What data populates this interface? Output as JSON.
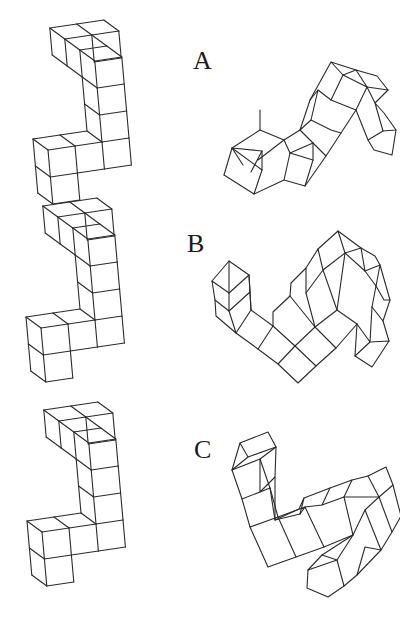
{
  "figure": {
    "pairs": [
      {
        "label": "A",
        "label_pos": [
          193,
          48
        ]
      },
      {
        "label": "B",
        "label_pos": [
          187,
          231
        ]
      },
      {
        "label": "C",
        "label_pos": [
          194,
          437
        ]
      }
    ]
  },
  "shapes": [
    {
      "id": "A-left",
      "cubes": 10,
      "origin": [
        48,
        150
      ],
      "vectors": {
        "a": [
          27,
          -4
        ],
        "v": [
          2.4,
          27
        ],
        "d": [
          -15,
          -11
        ]
      },
      "cells": [
        [
          0,
          0,
          0
        ],
        [
          0,
          1,
          0
        ],
        [
          1,
          0,
          0
        ],
        [
          2,
          0,
          0
        ],
        [
          2,
          -1,
          0
        ],
        [
          2,
          -2,
          0
        ],
        [
          2,
          -3,
          0
        ],
        [
          2,
          -3,
          1
        ],
        [
          2,
          -3,
          2
        ],
        [
          3,
          -3,
          2
        ]
      ]
    },
    {
      "id": "B-left",
      "cubes": 10,
      "origin": [
        41,
        328
      ],
      "vectors": {
        "a": [
          27,
          -4
        ],
        "v": [
          2.4,
          27
        ],
        "d": [
          -15,
          -11
        ]
      },
      "cells": [
        [
          0,
          0,
          0
        ],
        [
          0,
          1,
          0
        ],
        [
          1,
          0,
          0
        ],
        [
          2,
          0,
          0
        ],
        [
          2,
          -1,
          0
        ],
        [
          2,
          -2,
          0
        ],
        [
          2,
          -3,
          0
        ],
        [
          2,
          -3,
          1
        ],
        [
          2,
          -3,
          2
        ],
        [
          3,
          -3,
          2
        ]
      ]
    },
    {
      "id": "C-left",
      "cubes": 10,
      "origin": [
        42,
        532
      ],
      "vectors": {
        "a": [
          27,
          -4
        ],
        "v": [
          2.4,
          27
        ],
        "d": [
          -15,
          -11
        ]
      },
      "cells": [
        [
          0,
          0,
          0
        ],
        [
          0,
          1,
          0
        ],
        [
          1,
          0,
          0
        ],
        [
          2,
          0,
          0
        ],
        [
          2,
          -1,
          0
        ],
        [
          2,
          -2,
          0
        ],
        [
          2,
          -3,
          0
        ],
        [
          2,
          -3,
          1
        ],
        [
          2,
          -3,
          2
        ],
        [
          3,
          -3,
          2
        ]
      ]
    }
  ],
  "segments": {
    "A-right": [
      [
        [
          232,
          148
        ],
        [
          262,
          170
        ],
        [
          262,
          151
        ],
        [
          232,
          148
        ]
      ],
      [
        [
          232,
          148
        ],
        [
          260,
          130
        ],
        [
          284,
          140
        ],
        [
          258,
          160
        ]
      ],
      [
        [
          260,
          130
        ],
        [
          260,
          110
        ]
      ],
      [
        [
          224,
          175
        ],
        [
          232,
          148
        ]
      ],
      [
        [
          224,
          175
        ],
        [
          254,
          194
        ],
        [
          262,
          170
        ]
      ],
      [
        [
          254,
          194
        ],
        [
          284,
          180
        ],
        [
          290,
          153
        ]
      ],
      [
        [
          284,
          180
        ],
        [
          305,
          186
        ],
        [
          313,
          160
        ],
        [
          290,
          153
        ]
      ],
      [
        [
          284,
          140
        ],
        [
          290,
          153
        ]
      ],
      [
        [
          284,
          140
        ],
        [
          300,
          130
        ],
        [
          313,
          143
        ],
        [
          290,
          153
        ]
      ],
      [
        [
          313,
          143
        ],
        [
          313,
          160
        ]
      ],
      [
        [
          305,
          186
        ],
        [
          326,
          156
        ],
        [
          313,
          143
        ]
      ],
      [
        [
          300,
          130
        ],
        [
          310,
          100
        ],
        [
          318,
          90
        ],
        [
          311,
          120
        ],
        [
          300,
          130
        ]
      ],
      [
        [
          310,
          100
        ],
        [
          331,
          62
        ],
        [
          343,
          75
        ],
        [
          331,
          100
        ],
        [
          318,
          90
        ]
      ],
      [
        [
          331,
          62
        ],
        [
          356,
          70
        ],
        [
          343,
          75
        ]
      ],
      [
        [
          343,
          75
        ],
        [
          367,
          87
        ],
        [
          356,
          70
        ]
      ],
      [
        [
          331,
          100
        ],
        [
          356,
          110
        ],
        [
          367,
          87
        ]
      ],
      [
        [
          311,
          120
        ],
        [
          331,
          130
        ],
        [
          341,
          133
        ]
      ],
      [
        [
          326,
          156
        ],
        [
          341,
          133
        ],
        [
          356,
          110
        ]
      ],
      [
        [
          356,
          70
        ],
        [
          377,
          76
        ],
        [
          388,
          90
        ],
        [
          367,
          87
        ]
      ],
      [
        [
          367,
          87
        ],
        [
          375,
          103
        ],
        [
          388,
          90
        ]
      ],
      [
        [
          375,
          103
        ],
        [
          384,
          113
        ],
        [
          396,
          130
        ],
        [
          383,
          131
        ],
        [
          375,
          103
        ]
      ],
      [
        [
          356,
          110
        ],
        [
          368,
          140
        ],
        [
          383,
          131
        ]
      ],
      [
        [
          368,
          140
        ],
        [
          374,
          150
        ],
        [
          392,
          155
        ],
        [
          396,
          130
        ]
      ],
      [
        [
          251,
          172
        ],
        [
          262,
          151
        ]
      ],
      [
        [
          243,
          165
        ],
        [
          232,
          148
        ]
      ]
    ],
    "B-right": [
      [
        [
          212,
          281
        ],
        [
          229,
          261
        ],
        [
          249,
          275
        ],
        [
          229,
          293
        ],
        [
          212,
          281
        ]
      ],
      [
        [
          212,
          281
        ],
        [
          215,
          300
        ],
        [
          229,
          311
        ],
        [
          229,
          293
        ]
      ],
      [
        [
          215,
          300
        ],
        [
          216,
          316
        ],
        [
          236,
          333
        ],
        [
          229,
          311
        ]
      ],
      [
        [
          229,
          261
        ],
        [
          229,
          293
        ]
      ],
      [
        [
          249,
          275
        ],
        [
          250,
          292
        ],
        [
          229,
          311
        ]
      ],
      [
        [
          250,
          292
        ],
        [
          251,
          310
        ],
        [
          236,
          333
        ]
      ],
      [
        [
          251,
          310
        ],
        [
          273,
          326
        ]
      ],
      [
        [
          249,
          275
        ],
        [
          251,
          310
        ]
      ],
      [
        [
          236,
          333
        ],
        [
          258,
          349
        ],
        [
          273,
          326
        ]
      ],
      [
        [
          258,
          349
        ],
        [
          278,
          364
        ],
        [
          295,
          346
        ]
      ],
      [
        [
          273,
          326
        ],
        [
          295,
          346
        ]
      ],
      [
        [
          278,
          364
        ],
        [
          298,
          383
        ],
        [
          316,
          366
        ],
        [
          295,
          346
        ]
      ],
      [
        [
          273,
          326
        ],
        [
          273,
          312
        ],
        [
          290,
          296
        ]
      ],
      [
        [
          295,
          346
        ],
        [
          315,
          327
        ],
        [
          290,
          296
        ]
      ],
      [
        [
          316,
          366
        ],
        [
          336,
          348
        ],
        [
          315,
          327
        ]
      ],
      [
        [
          290,
          296
        ],
        [
          291,
          283
        ],
        [
          306,
          268
        ],
        [
          306,
          293
        ],
        [
          315,
          327
        ]
      ],
      [
        [
          306,
          268
        ],
        [
          318,
          249
        ],
        [
          323,
          270
        ],
        [
          306,
          293
        ]
      ],
      [
        [
          318,
          249
        ],
        [
          338,
          231
        ],
        [
          345,
          253
        ],
        [
          323,
          270
        ]
      ],
      [
        [
          315,
          327
        ],
        [
          337,
          310
        ],
        [
          323,
          270
        ]
      ],
      [
        [
          336,
          348
        ],
        [
          357,
          324
        ],
        [
          337,
          310
        ]
      ],
      [
        [
          337,
          310
        ],
        [
          345,
          253
        ]
      ],
      [
        [
          338,
          231
        ],
        [
          361,
          248
        ],
        [
          345,
          253
        ]
      ],
      [
        [
          361,
          248
        ],
        [
          365,
          271
        ],
        [
          345,
          253
        ]
      ],
      [
        [
          361,
          248
        ],
        [
          375,
          256
        ],
        [
          380,
          265
        ],
        [
          365,
          271
        ]
      ],
      [
        [
          365,
          271
        ],
        [
          376,
          286
        ],
        [
          380,
          265
        ]
      ],
      [
        [
          376,
          286
        ],
        [
          384,
          300
        ],
        [
          390,
          300
        ],
        [
          380,
          265
        ]
      ],
      [
        [
          357,
          324
        ],
        [
          370,
          342
        ],
        [
          372,
          307
        ]
      ],
      [
        [
          372,
          307
        ],
        [
          376,
          286
        ]
      ],
      [
        [
          372,
          307
        ],
        [
          383,
          321
        ],
        [
          390,
          300
        ]
      ],
      [
        [
          370,
          342
        ],
        [
          355,
          356
        ],
        [
          372,
          367
        ],
        [
          389,
          341
        ],
        [
          370,
          342
        ]
      ],
      [
        [
          389,
          341
        ],
        [
          383,
          321
        ]
      ],
      [
        [
          355,
          356
        ],
        [
          357,
          324
        ]
      ]
    ],
    "C-right": [
      [
        [
          240,
          443
        ],
        [
          268,
          432
        ],
        [
          276,
          447
        ],
        [
          248,
          457
        ],
        [
          240,
          443
        ]
      ],
      [
        [
          240,
          443
        ],
        [
          232,
          470
        ],
        [
          248,
          457
        ]
      ],
      [
        [
          232,
          470
        ],
        [
          260,
          459
        ],
        [
          276,
          447
        ]
      ],
      [
        [
          276,
          447
        ],
        [
          275,
          477
        ],
        [
          260,
          492
        ],
        [
          260,
          459
        ]
      ],
      [
        [
          232,
          470
        ],
        [
          242,
          499
        ],
        [
          270,
          488
        ],
        [
          260,
          459
        ]
      ],
      [
        [
          242,
          499
        ],
        [
          250,
          527
        ],
        [
          278,
          517
        ],
        [
          270,
          488
        ]
      ],
      [
        [
          250,
          527
        ],
        [
          268,
          567
        ],
        [
          296,
          557
        ],
        [
          278,
          517
        ]
      ],
      [
        [
          270,
          488
        ],
        [
          275,
          520
        ],
        [
          300,
          514
        ]
      ],
      [
        [
          275,
          477
        ],
        [
          275,
          520
        ]
      ],
      [
        [
          278,
          517
        ],
        [
          305,
          507
        ],
        [
          300,
          514
        ]
      ],
      [
        [
          296,
          557
        ],
        [
          324,
          547
        ],
        [
          305,
          507
        ]
      ],
      [
        [
          275,
          520
        ],
        [
          299,
          509
        ],
        [
          304,
          498
        ],
        [
          330,
          488
        ],
        [
          322,
          505
        ],
        [
          305,
          507
        ]
      ],
      [
        [
          304,
          498
        ],
        [
          300,
          514
        ]
      ],
      [
        [
          330,
          488
        ],
        [
          352,
          480
        ],
        [
          344,
          497
        ],
        [
          322,
          505
        ]
      ],
      [
        [
          344,
          497
        ],
        [
          353,
          535
        ],
        [
          324,
          547
        ]
      ],
      [
        [
          352,
          480
        ],
        [
          368,
          476
        ],
        [
          379,
          497
        ],
        [
          344,
          497
        ]
      ],
      [
        [
          379,
          497
        ],
        [
          365,
          510
        ],
        [
          353,
          535
        ]
      ],
      [
        [
          368,
          476
        ],
        [
          386,
          467
        ],
        [
          393,
          485
        ],
        [
          379,
          497
        ]
      ],
      [
        [
          393,
          485
        ],
        [
          401,
          516
        ],
        [
          392,
          532
        ],
        [
          379,
          497
        ]
      ],
      [
        [
          392,
          532
        ],
        [
          381,
          550
        ],
        [
          365,
          510
        ]
      ],
      [
        [
          353,
          535
        ],
        [
          337,
          560
        ],
        [
          308,
          570
        ],
        [
          307,
          588
        ],
        [
          328,
          597
        ],
        [
          344,
          586
        ],
        [
          337,
          560
        ]
      ],
      [
        [
          308,
          570
        ],
        [
          322,
          555
        ],
        [
          353,
          535
        ]
      ],
      [
        [
          344,
          586
        ],
        [
          357,
          575
        ],
        [
          381,
          550
        ]
      ],
      [
        [
          322,
          555
        ],
        [
          337,
          560
        ]
      ],
      [
        [
          357,
          575
        ],
        [
          365,
          547
        ],
        [
          381,
          550
        ]
      ]
    ]
  }
}
